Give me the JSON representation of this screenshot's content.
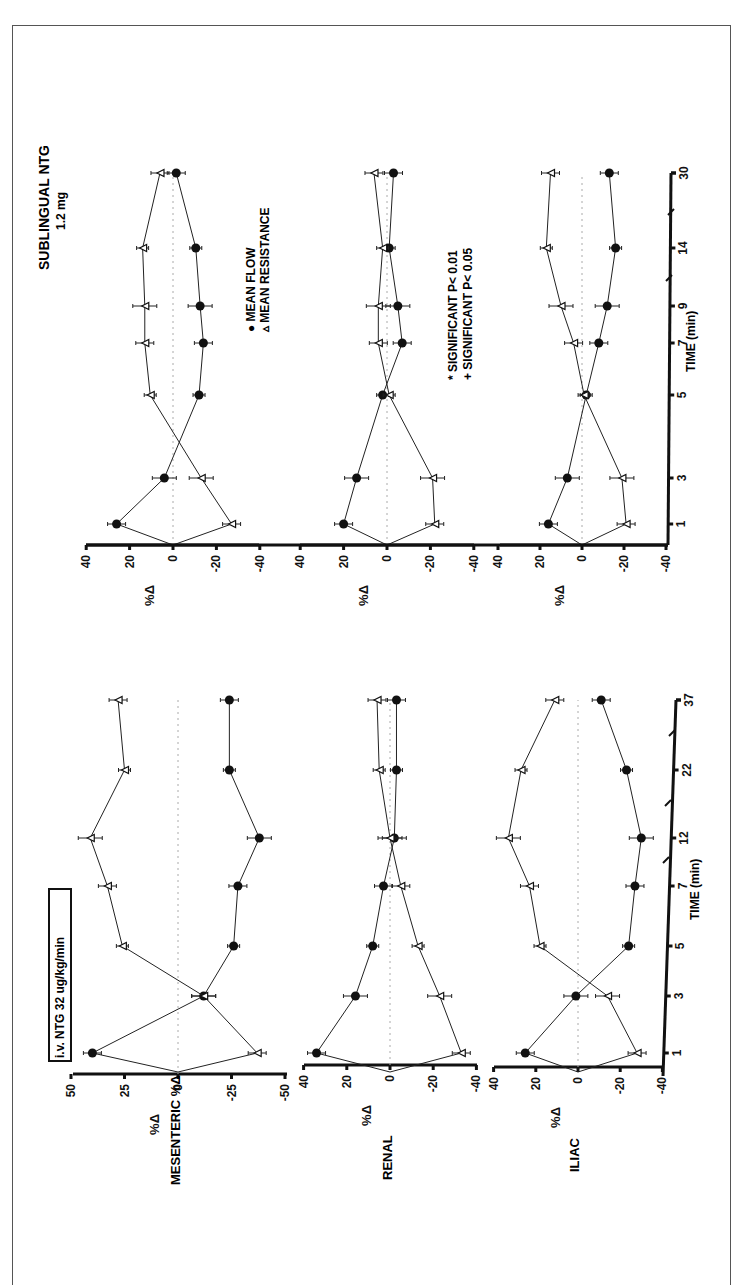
{
  "figure": {
    "left_title": "i.v. NTG 32 ug/kg/min",
    "right_title": "SUBLINGUAL NTG",
    "right_subtitle": "1.2 mg",
    "legend": [
      {
        "symbol": "filled-circle",
        "label": "MEAN  FLOW"
      },
      {
        "symbol": "open-triangle",
        "label": "MEAN  RESISTANCE"
      }
    ],
    "significance": [
      {
        "symbol": "*",
        "label": "SIGNIFICANT  P< 0.01"
      },
      {
        "symbol": "+",
        "label": "SIGNIFICANT  P< 0.05"
      }
    ],
    "row_labels": [
      "MESENTERIC",
      "RENAL",
      "ILIAC"
    ],
    "ylabel": "%Δ",
    "xlabel": "TIME (min)"
  },
  "chart_data": [
    {
      "type": "line",
      "title": "i.v. NTG 32 ug/kg/min — MESENTERIC",
      "xlabel": "TIME (min)",
      "ylabel": "MESENTERIC %Δ",
      "x": [
        0,
        1,
        3,
        5,
        7,
        12,
        22,
        37
      ],
      "x_ticks": [
        "1",
        "3",
        "5",
        "7",
        "12",
        "22",
        "37"
      ],
      "ylim": [
        -50,
        50
      ],
      "y_ticks": [
        "50",
        "25",
        "0",
        "-25",
        "-50"
      ],
      "series": [
        {
          "name": "MEAN FLOW",
          "values": [
            0,
            40,
            -12,
            -26,
            -28,
            -38,
            -24,
            -24
          ]
        },
        {
          "name": "MEAN RESISTANCE",
          "values": [
            0,
            -37,
            -12,
            26,
            33,
            41,
            25,
            28
          ]
        }
      ]
    },
    {
      "type": "line",
      "title": "i.v. NTG 32 ug/kg/min — RENAL",
      "xlabel": "TIME (min)",
      "ylabel": "%Δ",
      "x": [
        0,
        1,
        3,
        5,
        7,
        12,
        22,
        37
      ],
      "x_ticks": [
        "1",
        "3",
        "5",
        "7",
        "12",
        "22",
        "37"
      ],
      "ylim": [
        -40,
        40
      ],
      "y_ticks": [
        "40",
        "20",
        "0",
        "-20",
        "-40"
      ],
      "series": [
        {
          "name": "MEAN FLOW",
          "values": [
            0,
            34,
            16,
            8,
            3,
            -2,
            -3,
            -3
          ]
        },
        {
          "name": "MEAN RESISTANCE",
          "values": [
            0,
            -33,
            -23,
            -13,
            -5,
            0,
            5,
            6
          ]
        }
      ]
    },
    {
      "type": "line",
      "title": "i.v. NTG 32 ug/kg/min — ILIAC",
      "xlabel": "TIME (min)",
      "ylabel": "%Δ",
      "x": [
        0,
        1,
        3,
        5,
        7,
        12,
        22,
        37
      ],
      "x_ticks": [
        "1",
        "3",
        "5",
        "7",
        "12",
        "22",
        "37"
      ],
      "ylim": [
        -40,
        40
      ],
      "y_ticks": [
        "40",
        "20",
        "0",
        "-20",
        "-40"
      ],
      "series": [
        {
          "name": "MEAN FLOW",
          "values": [
            0,
            25,
            1,
            -24,
            -27,
            -30,
            -23,
            -11
          ]
        },
        {
          "name": "MEAN RESISTANCE",
          "values": [
            0,
            -28,
            -14,
            18,
            23,
            33,
            27,
            11
          ]
        }
      ]
    },
    {
      "type": "line",
      "title": "SUBLINGUAL NTG 1.2 mg — MESENTERIC",
      "xlabel": "TIME (min)",
      "ylabel": "%Δ",
      "x": [
        0,
        1,
        3,
        5,
        7,
        9,
        14,
        30
      ],
      "x_ticks": [
        "1",
        "3",
        "5",
        "7",
        "9",
        "14",
        "30"
      ],
      "ylim": [
        -40,
        40
      ],
      "y_ticks": [
        "40",
        "20",
        "0",
        "-20",
        "-40"
      ],
      "series": [
        {
          "name": "MEAN FLOW",
          "values": [
            0,
            26,
            4,
            -12,
            -14,
            -12.5,
            -10.5,
            -1.5
          ]
        },
        {
          "name": "MEAN RESISTANCE",
          "values": [
            0,
            -27,
            -13,
            10.5,
            13,
            13,
            14,
            6
          ]
        }
      ]
    },
    {
      "type": "line",
      "title": "SUBLINGUAL NTG 1.2 mg — RENAL",
      "xlabel": "TIME (min)",
      "ylabel": "%Δ",
      "x": [
        0,
        1,
        3,
        5,
        7,
        9,
        14,
        30
      ],
      "x_ticks": [
        "1",
        "3",
        "5",
        "7",
        "9",
        "14",
        "30"
      ],
      "ylim": [
        -40,
        40
      ],
      "y_ticks": [
        "40",
        "20",
        "0",
        "-20",
        "-40"
      ],
      "series": [
        {
          "name": "MEAN FLOW",
          "values": [
            0,
            20,
            14,
            2,
            -7,
            -5,
            -1,
            -3
          ]
        },
        {
          "name": "MEAN RESISTANCE",
          "values": [
            0,
            -22,
            -21,
            -1,
            4,
            4,
            2,
            6
          ]
        }
      ]
    },
    {
      "type": "line",
      "title": "SUBLINGUAL NTG 1.2 mg — ILIAC",
      "xlabel": "TIME (min)",
      "ylabel": "%Δ",
      "x": [
        0,
        1,
        3,
        5,
        7,
        9,
        14,
        30
      ],
      "x_ticks": [
        "1",
        "3",
        "5",
        "7",
        "9",
        "14",
        "30"
      ],
      "ylim": [
        -40,
        40
      ],
      "y_ticks": [
        "40",
        "20",
        "0",
        "-20",
        "-40"
      ],
      "series": [
        {
          "name": "MEAN FLOW",
          "values": [
            0,
            16,
            7,
            -2,
            -8,
            -12,
            -16,
            -13
          ]
        },
        {
          "name": "MEAN RESISTANCE",
          "values": [
            0,
            -21,
            -19,
            -1,
            4,
            10,
            17,
            15
          ]
        }
      ]
    }
  ]
}
